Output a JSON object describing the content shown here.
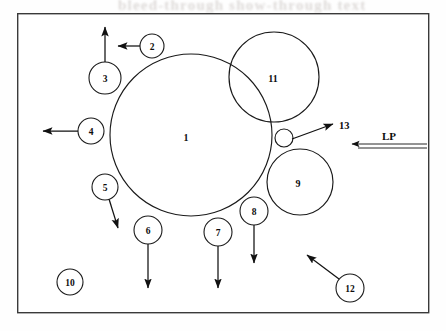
{
  "figure": {
    "kind": "schematic-callout-diagram",
    "frame": {
      "x": 17,
      "y": 13,
      "width": 411,
      "height": 299
    },
    "background_color": "#ffffff",
    "line_color": "#1a1a1a",
    "frame_color": "#3a3a3a"
  },
  "bleed_through": {
    "top_text": "bleed-through show-through text"
  },
  "shapes": [
    {
      "name": "main-circle",
      "label": "1",
      "cx": 191,
      "cy": 135,
      "r": 81,
      "label_x": 186,
      "label_y": 137
    },
    {
      "name": "upper-right-circle",
      "label": "11",
      "cx": 274,
      "cy": 77,
      "r": 45,
      "label_x": 273,
      "label_y": 78
    },
    {
      "name": "lower-right-circle",
      "label": "9",
      "cx": 300,
      "cy": 182,
      "r": 33,
      "label_x": 298,
      "label_y": 183
    },
    {
      "name": "small-nozzle-circle",
      "label": "",
      "cx": 284,
      "cy": 138,
      "r": 9,
      "label_x": 284,
      "label_y": 138
    }
  ],
  "callouts": [
    {
      "id": "2",
      "cx": 152,
      "cy": 46,
      "r": 12,
      "arrow": {
        "type": "line",
        "x1": 140,
        "y1": 46,
        "x2": 118,
        "y2": 46
      }
    },
    {
      "id": "3",
      "cx": 105,
      "cy": 78,
      "r": 16,
      "arrow": {
        "type": "line",
        "x1": 105,
        "y1": 62,
        "x2": 105,
        "y2": 27
      }
    },
    {
      "id": "4",
      "cx": 91,
      "cy": 131,
      "r": 13,
      "arrow": {
        "type": "line",
        "x1": 78,
        "y1": 131,
        "x2": 43,
        "y2": 131
      }
    },
    {
      "id": "5",
      "cx": 105,
      "cy": 187,
      "r": 13,
      "arrow": {
        "type": "line",
        "x1": 109,
        "y1": 199,
        "x2": 118,
        "y2": 228
      }
    },
    {
      "id": "6",
      "cx": 148,
      "cy": 230,
      "r": 14,
      "arrow": {
        "type": "line",
        "x1": 148,
        "y1": 244,
        "x2": 148,
        "y2": 288
      }
    },
    {
      "id": "7",
      "cx": 218,
      "cy": 232,
      "r": 14,
      "arrow": {
        "type": "line",
        "x1": 218,
        "y1": 246,
        "x2": 218,
        "y2": 288
      }
    },
    {
      "id": "8",
      "cx": 254,
      "cy": 211,
      "r": 14,
      "arrow": {
        "type": "line",
        "x1": 254,
        "y1": 225,
        "x2": 254,
        "y2": 263
      }
    },
    {
      "id": "10",
      "cx": 70,
      "cy": 282,
      "r": 13,
      "arrow": null
    },
    {
      "id": "12",
      "cx": 350,
      "cy": 288,
      "r": 14,
      "arrow": {
        "type": "line",
        "x1": 339,
        "y1": 279,
        "x2": 307,
        "y2": 255
      }
    }
  ],
  "plain_labels": [
    {
      "id": "13",
      "text": "13",
      "x": 339,
      "y": 125,
      "arrow": {
        "x1": 292,
        "y1": 139,
        "x2": 333,
        "y2": 124
      }
    }
  ],
  "flow_arrow": {
    "name": "LP",
    "label": "LP",
    "label_x": 389,
    "label_y": 136,
    "tail_x": 427,
    "tip_x": 352,
    "y_upper": 144,
    "y_lower": 148
  }
}
